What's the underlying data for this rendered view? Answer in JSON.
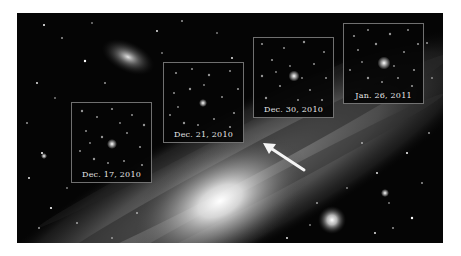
{
  "figure": {
    "colors": {
      "background": "#ffffff",
      "sky": "#050505",
      "inset_border": "#c8c8c8",
      "label_text": "#e8e8e8",
      "arrow": "#f5f5f5"
    },
    "insets": [
      {
        "label": "Dec. 17, 2010",
        "left": 54,
        "top": 89,
        "width": 81,
        "height": 81
      },
      {
        "label": "Dec. 21, 2010",
        "left": 146,
        "top": 49,
        "width": 81,
        "height": 81
      },
      {
        "label": "Dec. 30, 2010",
        "left": 236,
        "top": 24,
        "width": 81,
        "height": 81
      },
      {
        "label": "Jan. 26, 2011",
        "left": 326,
        "top": 10,
        "width": 81,
        "height": 81
      }
    ],
    "arrow": {
      "tip": [
        246,
        130
      ],
      "tail": [
        287,
        157
      ]
    }
  }
}
